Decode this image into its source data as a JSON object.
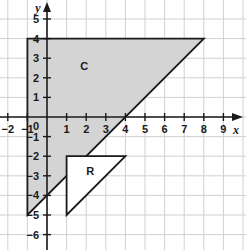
{
  "figure": {
    "width": 246,
    "height": 250,
    "background_color": "#ffffff",
    "grid_color": "#d0d0d0",
    "grid_minor_color": "#e8e8e8",
    "axis_color": "#1a1a1a",
    "shape_stroke_color": "#1a1a1a",
    "shaded_fill_color": "#d4d4d4",
    "unshaded_fill_color": "#ffffff"
  },
  "axes": {
    "x_label": "x",
    "y_label": "y",
    "x_min": -2.5,
    "x_max": 9.9,
    "y_min": -6.7,
    "y_max": 5.9,
    "unit_px": 19.6,
    "origin_px_x": 47,
    "origin_px_y": 117,
    "origin_label": "0",
    "x_ticks": [
      {
        "value": -2,
        "label": "-2"
      },
      {
        "value": -1,
        "label": "-1"
      },
      {
        "value": 1,
        "label": "1"
      },
      {
        "value": 2,
        "label": "2"
      },
      {
        "value": 3,
        "label": "3"
      },
      {
        "value": 4,
        "label": "4"
      },
      {
        "value": 5,
        "label": "5"
      },
      {
        "value": 6,
        "label": "6"
      },
      {
        "value": 7,
        "label": "7"
      },
      {
        "value": 8,
        "label": "8"
      },
      {
        "value": 9,
        "label": "9"
      }
    ],
    "y_ticks": [
      {
        "value": 5,
        "label": "5"
      },
      {
        "value": 4,
        "label": "4"
      },
      {
        "value": 3,
        "label": "3"
      },
      {
        "value": 2,
        "label": "2"
      },
      {
        "value": 1,
        "label": "1"
      },
      {
        "value": -1,
        "label": "-1"
      },
      {
        "value": -2,
        "label": "-2"
      },
      {
        "value": -3,
        "label": "-3"
      },
      {
        "value": -4,
        "label": "-4"
      },
      {
        "value": -5,
        "label": "-5"
      },
      {
        "value": -6,
        "label": "-6"
      }
    ]
  },
  "chart_data": {
    "type": "scatter",
    "title": "",
    "xlabel": "x",
    "ylabel": "y",
    "xlim": [
      -2.5,
      9.9
    ],
    "ylim": [
      -6.7,
      5.9
    ],
    "grid": true,
    "legend": "none",
    "shapes": [
      {
        "name": "C",
        "label": "C",
        "kind": "triangle",
        "filled": true,
        "fill": "#d4d4d4",
        "vertices": [
          [
            -1,
            4
          ],
          [
            8,
            4
          ],
          [
            -1,
            -5
          ]
        ],
        "label_position": [
          1.9,
          2.6
        ]
      },
      {
        "name": "R",
        "label": "R",
        "kind": "triangle",
        "filled": false,
        "fill": "#ffffff",
        "vertices": [
          [
            1,
            -2
          ],
          [
            4,
            -2
          ],
          [
            1,
            -5
          ]
        ],
        "label_position": [
          2.2,
          -2.75
        ]
      }
    ]
  }
}
